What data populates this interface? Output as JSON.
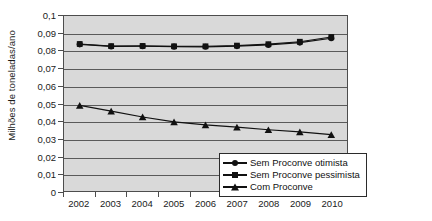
{
  "chart_data": {
    "type": "line",
    "title": "",
    "xlabel": "",
    "ylabel": "Milhões de toneladas/ano",
    "categories": [
      "2002",
      "2003",
      "2004",
      "2005",
      "2006",
      "2007",
      "2008",
      "2009",
      "2010"
    ],
    "x": [
      2002,
      2003,
      2004,
      2005,
      2006,
      2007,
      2008,
      2009,
      2010
    ],
    "ylim": [
      0,
      0.1
    ],
    "y_ticks": [
      0,
      0.01,
      0.02,
      0.03,
      0.04,
      0.05,
      0.06,
      0.07,
      0.08,
      0.09,
      0.1
    ],
    "y_tick_labels": [
      "0",
      "0,01",
      "0,02",
      "0,03",
      "0,04",
      "0,05",
      "0,06",
      "0,07",
      "0,08",
      "0,09",
      "0,1"
    ],
    "grid": true,
    "grid_axis": "y",
    "legend_position": "bottom-right",
    "plot_background": "#d9d9d9",
    "series": [
      {
        "name": "Sem Proconve otimista",
        "marker": "circle",
        "color": "#111111",
        "values": [
          0.0838,
          0.0826,
          0.0827,
          0.0825,
          0.0824,
          0.0828,
          0.0835,
          0.0848,
          0.0873
        ]
      },
      {
        "name": "Sem Proconve pessimista",
        "marker": "square",
        "color": "#111111",
        "values": [
          0.084,
          0.0828,
          0.0829,
          0.0827,
          0.0827,
          0.0831,
          0.0839,
          0.0853,
          0.088
        ]
      },
      {
        "name": "Com Proconve",
        "marker": "triangle",
        "color": "#111111",
        "values": [
          0.0489,
          0.0456,
          0.0423,
          0.0395,
          0.0378,
          0.0365,
          0.035,
          0.0338,
          0.0322
        ]
      }
    ]
  },
  "legend": {
    "items": [
      {
        "label": "Sem Proconve otimista",
        "marker": "circle"
      },
      {
        "label": "Sem Proconve pessimista",
        "marker": "square"
      },
      {
        "label": "Com Proconve",
        "marker": "triangle"
      }
    ]
  }
}
